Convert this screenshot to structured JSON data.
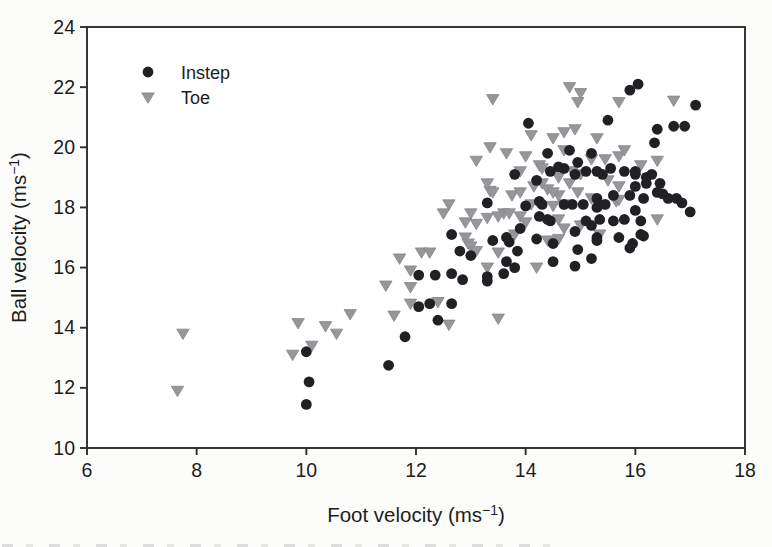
{
  "figure": {
    "legend": {
      "entries": [
        {
          "label": "Instep",
          "marker": "circle-filled",
          "color": "#212125"
        },
        {
          "label": "Toe",
          "marker": "triangle-down-filled",
          "color": "#97979b"
        }
      ]
    },
    "colors": {
      "background": "#fcfcfb",
      "frame": "#2e2e2e",
      "text": "#1c1c1c",
      "instep_marker": "#212125",
      "toe_marker": "#97979b",
      "toe_marker_edge": "#85858a"
    }
  },
  "chart_data": {
    "type": "scatter",
    "title": "",
    "xlabel": {
      "pre": "Foot velocity (ms",
      "sup": "−1",
      "post": ")"
    },
    "ylabel": {
      "pre": "Ball velocity (ms",
      "sup": "−1",
      "post": ")"
    },
    "xlim": [
      6,
      18
    ],
    "ylim": [
      10,
      24
    ],
    "xticks": [
      6,
      8,
      10,
      12,
      14,
      16,
      18
    ],
    "yticks": [
      10,
      12,
      14,
      16,
      18,
      20,
      22,
      24
    ],
    "grid": false,
    "legend_position": "top-left-inside",
    "series": [
      {
        "name": "Instep",
        "marker": "circle",
        "color": "#212125",
        "points": [
          [
            10.0,
            13.2
          ],
          [
            10.05,
            12.2
          ],
          [
            10.0,
            11.45
          ],
          [
            11.5,
            12.75
          ],
          [
            11.8,
            13.7
          ],
          [
            12.05,
            14.7
          ],
          [
            12.25,
            14.8
          ],
          [
            12.65,
            14.8
          ],
          [
            12.4,
            14.25
          ],
          [
            12.05,
            15.75
          ],
          [
            12.35,
            15.75
          ],
          [
            12.65,
            15.8
          ],
          [
            12.85,
            15.6
          ],
          [
            13.3,
            15.7
          ],
          [
            13.6,
            15.8
          ],
          [
            13.3,
            15.55
          ],
          [
            12.65,
            17.1
          ],
          [
            12.8,
            16.55
          ],
          [
            13.0,
            16.4
          ],
          [
            13.4,
            16.9
          ],
          [
            13.7,
            16.85
          ],
          [
            13.85,
            16.55
          ],
          [
            13.65,
            16.2
          ],
          [
            13.8,
            16.0
          ],
          [
            14.5,
            16.2
          ],
          [
            14.9,
            16.05
          ],
          [
            15.2,
            16.3
          ],
          [
            14.95,
            16.6
          ],
          [
            15.95,
            16.8
          ],
          [
            16.1,
            17.1
          ],
          [
            15.9,
            16.65
          ],
          [
            13.65,
            17.0
          ],
          [
            13.9,
            17.3
          ],
          [
            14.2,
            16.95
          ],
          [
            14.5,
            16.8
          ],
          [
            14.9,
            17.2
          ],
          [
            15.3,
            17.0
          ],
          [
            15.7,
            17.0
          ],
          [
            15.3,
            16.9
          ],
          [
            16.15,
            17.05
          ],
          [
            14.25,
            17.7
          ],
          [
            14.45,
            17.55
          ],
          [
            14.4,
            17.6
          ],
          [
            15.1,
            17.55
          ],
          [
            15.35,
            17.6
          ],
          [
            15.6,
            17.55
          ],
          [
            15.8,
            17.6
          ],
          [
            16.1,
            17.55
          ],
          [
            15.2,
            17.4
          ],
          [
            17.0,
            17.85
          ],
          [
            16.0,
            17.9
          ],
          [
            13.3,
            18.15
          ],
          [
            14.0,
            18.05
          ],
          [
            14.25,
            18.2
          ],
          [
            14.3,
            18.1
          ],
          [
            14.7,
            18.1
          ],
          [
            14.85,
            18.1
          ],
          [
            15.05,
            18.1
          ],
          [
            15.3,
            18.0
          ],
          [
            15.45,
            18.1
          ],
          [
            14.2,
            18.9
          ],
          [
            15.3,
            18.3
          ],
          [
            15.6,
            18.4
          ],
          [
            15.9,
            18.4
          ],
          [
            16.15,
            18.3
          ],
          [
            16.4,
            18.5
          ],
          [
            16.6,
            18.3
          ],
          [
            16.75,
            18.3
          ],
          [
            16.85,
            18.15
          ],
          [
            16.0,
            18.7
          ],
          [
            16.2,
            18.8
          ],
          [
            16.45,
            18.8
          ],
          [
            16.5,
            18.45
          ],
          [
            14.45,
            19.2
          ],
          [
            14.7,
            19.3
          ],
          [
            14.9,
            19.1
          ],
          [
            15.1,
            19.2
          ],
          [
            15.3,
            19.2
          ],
          [
            15.55,
            19.3
          ],
          [
            15.8,
            19.2
          ],
          [
            16.0,
            19.2
          ],
          [
            16.2,
            19.0
          ],
          [
            16.0,
            19.1
          ],
          [
            16.3,
            19.1
          ],
          [
            14.6,
            19.35
          ],
          [
            14.95,
            19.5
          ],
          [
            15.4,
            19.1
          ],
          [
            13.8,
            19.1
          ],
          [
            14.4,
            19.8
          ],
          [
            14.8,
            19.9
          ],
          [
            15.2,
            19.8
          ],
          [
            16.35,
            20.15
          ],
          [
            14.05,
            20.8
          ],
          [
            15.5,
            20.9
          ],
          [
            16.4,
            20.6
          ],
          [
            16.7,
            20.7
          ],
          [
            16.9,
            20.7
          ],
          [
            15.9,
            21.9
          ],
          [
            16.05,
            22.1
          ],
          [
            17.1,
            21.4
          ]
        ]
      },
      {
        "name": "Toe",
        "marker": "triangle-down",
        "color": "#97979b",
        "points": [
          [
            7.75,
            13.8
          ],
          [
            7.65,
            11.9
          ],
          [
            9.75,
            13.1
          ],
          [
            9.85,
            14.15
          ],
          [
            10.1,
            13.4
          ],
          [
            10.35,
            14.05
          ],
          [
            10.55,
            13.8
          ],
          [
            10.8,
            14.45
          ],
          [
            11.6,
            14.4
          ],
          [
            11.9,
            14.8
          ],
          [
            12.4,
            14.85
          ],
          [
            12.6,
            14.1
          ],
          [
            13.5,
            14.3
          ],
          [
            11.45,
            15.4
          ],
          [
            11.9,
            15.35
          ],
          [
            11.9,
            15.9
          ],
          [
            11.7,
            16.3
          ],
          [
            12.1,
            16.5
          ],
          [
            12.25,
            16.5
          ],
          [
            12.9,
            17.0
          ],
          [
            12.95,
            16.8
          ],
          [
            13.0,
            16.7
          ],
          [
            13.1,
            16.55
          ],
          [
            13.5,
            16.5
          ],
          [
            13.3,
            16.0
          ],
          [
            14.2,
            16.0
          ],
          [
            12.9,
            17.5
          ],
          [
            13.1,
            17.45
          ],
          [
            12.5,
            17.8
          ],
          [
            12.6,
            18.1
          ],
          [
            13.0,
            17.8
          ],
          [
            13.3,
            17.65
          ],
          [
            13.6,
            17.8
          ],
          [
            13.7,
            17.8
          ],
          [
            13.9,
            17.7
          ],
          [
            13.5,
            17.7
          ],
          [
            14.0,
            17.5
          ],
          [
            13.8,
            17.1
          ],
          [
            14.4,
            16.9
          ],
          [
            14.6,
            16.95
          ],
          [
            14.7,
            17.3
          ],
          [
            14.6,
            17.6
          ],
          [
            16.4,
            17.6
          ],
          [
            13.35,
            18.55
          ],
          [
            13.75,
            18.4
          ],
          [
            14.15,
            18.7
          ],
          [
            14.5,
            18.05
          ],
          [
            14.1,
            18.1
          ],
          [
            14.7,
            18.1
          ],
          [
            15.0,
            17.4
          ],
          [
            15.35,
            17.1
          ],
          [
            15.65,
            18.2
          ],
          [
            15.7,
            18.25
          ],
          [
            15.2,
            18.3
          ],
          [
            14.95,
            18.5
          ],
          [
            14.6,
            18.4
          ],
          [
            14.4,
            18.6
          ],
          [
            14.5,
            18.5
          ],
          [
            13.9,
            18.5
          ],
          [
            13.4,
            18.5
          ],
          [
            13.3,
            18.8
          ],
          [
            14.3,
            18.8
          ],
          [
            14.8,
            18.8
          ],
          [
            15.5,
            18.9
          ],
          [
            15.7,
            18.7
          ],
          [
            13.1,
            19.55
          ],
          [
            13.35,
            20.0
          ],
          [
            13.65,
            19.8
          ],
          [
            14.0,
            19.7
          ],
          [
            13.9,
            19.2
          ],
          [
            14.25,
            19.4
          ],
          [
            14.3,
            19.3
          ],
          [
            14.6,
            19.0
          ],
          [
            14.85,
            19.2
          ],
          [
            15.0,
            19.1
          ],
          [
            16.1,
            19.4
          ],
          [
            16.4,
            19.55
          ],
          [
            14.7,
            19.9
          ],
          [
            15.2,
            19.6
          ],
          [
            15.45,
            19.6
          ],
          [
            15.7,
            19.7
          ],
          [
            15.8,
            19.9
          ],
          [
            14.1,
            20.4
          ],
          [
            14.5,
            20.3
          ],
          [
            14.7,
            20.5
          ],
          [
            14.9,
            20.6
          ],
          [
            15.3,
            20.3
          ],
          [
            13.4,
            21.6
          ],
          [
            14.8,
            22.0
          ],
          [
            15.0,
            21.8
          ],
          [
            14.95,
            21.5
          ],
          [
            15.7,
            21.5
          ],
          [
            16.7,
            21.55
          ]
        ]
      }
    ]
  }
}
